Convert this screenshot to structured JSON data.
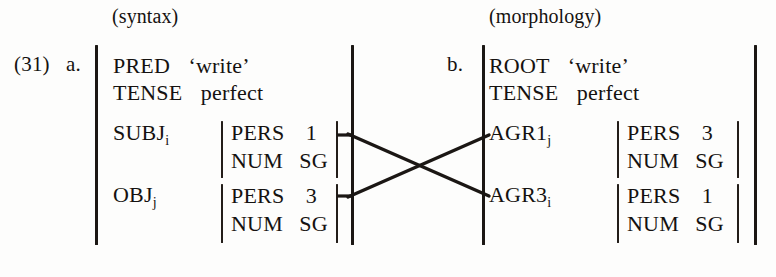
{
  "figure": {
    "example_number": "(31)",
    "headers": {
      "left": "(syntax)",
      "right": "(morphology)"
    },
    "panels": [
      {
        "id": "a",
        "label": "a.",
        "domain": "syntax",
        "top_features": [
          {
            "attribute": "PRED",
            "value": "‘write’"
          },
          {
            "attribute": "TENSE",
            "value": "perfect"
          }
        ],
        "grammatical_functions": [
          {
            "name": "SUBJ",
            "index": "i",
            "features": [
              {
                "attribute": "PERS",
                "value": "1"
              },
              {
                "attribute": "NUM",
                "value": "SG"
              }
            ]
          },
          {
            "name": "OBJ",
            "index": "j",
            "features": [
              {
                "attribute": "PERS",
                "value": "3"
              },
              {
                "attribute": "NUM",
                "value": "SG"
              }
            ]
          }
        ]
      },
      {
        "id": "b",
        "label": "b.",
        "domain": "morphology",
        "top_features": [
          {
            "attribute": "ROOT",
            "value": "‘write’"
          },
          {
            "attribute": "TENSE",
            "value": "perfect"
          }
        ],
        "grammatical_functions": [
          {
            "name": "AGR1",
            "index": "j",
            "features": [
              {
                "attribute": "PERS",
                "value": "3"
              },
              {
                "attribute": "NUM",
                "value": "SG"
              }
            ]
          },
          {
            "name": "AGR3",
            "index": "i",
            "features": [
              {
                "attribute": "PERS",
                "value": "1"
              },
              {
                "attribute": "NUM",
                "value": "SG"
              }
            ]
          }
        ]
      }
    ],
    "correspondence_links": [
      {
        "from": "SUBJ",
        "to": "AGR3",
        "description": "crossing association line"
      },
      {
        "from": "OBJ",
        "to": "AGR1",
        "description": "crossing association line"
      }
    ],
    "colors": {
      "ink": "#1b1714",
      "paper": "#fdfdfc"
    }
  }
}
